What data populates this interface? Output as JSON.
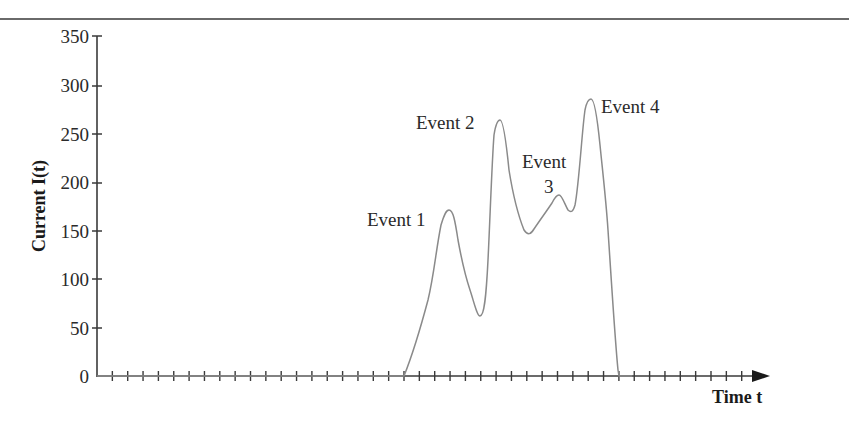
{
  "chart_data": {
    "type": "line",
    "title": "",
    "xlabel": "Time t",
    "ylabel": "Current I(t)",
    "ylim": [
      0,
      350
    ],
    "yticks": [
      0,
      50,
      100,
      150,
      200,
      250,
      300,
      350
    ],
    "ytick_labels": [
      "0",
      "50",
      "100",
      "150",
      "200",
      "250",
      "300",
      "350"
    ],
    "x_tick_count": 43,
    "x_tick_labels": [],
    "grid": false,
    "legend": null,
    "series": [
      {
        "name": "Current I(t)",
        "color": "#8a8a8a",
        "x": [
          0,
          20,
          20.5,
          21,
          21.5,
          22,
          22.5,
          23,
          23.5,
          24,
          24.5,
          25,
          25.5,
          26,
          26.5,
          27,
          27.5,
          28,
          28.5,
          29,
          29.5,
          30,
          30.5,
          31,
          31.5,
          32,
          33
        ],
        "y": [
          0,
          0,
          55,
          110,
          150,
          171,
          140,
          90,
          62,
          120,
          264,
          230,
          180,
          150,
          160,
          187,
          175,
          170,
          230,
          285,
          220,
          120,
          0,
          0,
          0,
          0,
          0
        ]
      }
    ],
    "annotations": [
      {
        "text": "Event 1",
        "near_y": 171
      },
      {
        "text": "Event 2",
        "near_y": 264
      },
      {
        "text": "Event 3",
        "near_y": 187
      },
      {
        "text": "Event 4",
        "near_y": 285
      }
    ]
  },
  "labels": {
    "y_axis_title": "Current I(t)",
    "x_axis_title": "Time t",
    "event1": "Event 1",
    "event2": "Event 2",
    "event3_line1": "Event",
    "event3_line2": "3",
    "event4": "Event 4",
    "y0": "0",
    "y50": "50",
    "y100": "100",
    "y150": "150",
    "y200": "200",
    "y250": "250",
    "y300": "300",
    "y350": "350"
  }
}
